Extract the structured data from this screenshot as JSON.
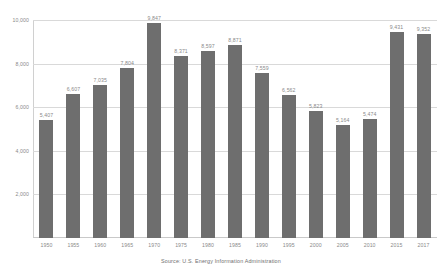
{
  "chart_data": {
    "type": "bar",
    "title": "",
    "subtitle": "",
    "xlabel": "",
    "ylabel": "",
    "ylim": [
      0,
      10000
    ],
    "yticks": [
      2000,
      4000,
      6000,
      8000,
      10000
    ],
    "ytick_labels": [
      "2,000",
      "4,000",
      "6,000",
      "8,000",
      "10,000"
    ],
    "grid": true,
    "legend": false,
    "legend_position": "none",
    "bar_color": "#6e6e6e",
    "categories": [
      "1950",
      "1955",
      "1960",
      "1965",
      "1970",
      "1975",
      "1980",
      "1985",
      "1990",
      "1995",
      "2000",
      "2005",
      "2010",
      "2015",
      "2017"
    ],
    "values": [
      5407,
      6607,
      7035,
      7804,
      9847,
      8371,
      8597,
      8871,
      7559,
      6562,
      5823,
      5164,
      5474,
      9431,
      9352
    ],
    "value_labels": [
      "5,407",
      "6,607",
      "7,035",
      "7,804",
      "9,847",
      "8,371",
      "8,597",
      "8,871",
      "7,559",
      "6,562",
      "5,823",
      "5,164",
      "5,474",
      "9,431",
      "9,352"
    ],
    "annotations": [
      "Source: U.S. Energy Information Administration"
    ]
  },
  "caption": {
    "source": "Source: U.S. Energy Information Administration"
  }
}
